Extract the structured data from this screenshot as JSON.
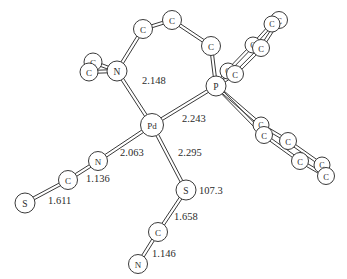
{
  "figure": {
    "background_color": "#ffffff",
    "line_color": "#3a3a3a",
    "text_color": "#2b2b2b"
  },
  "atoms": [
    {
      "id": "pd",
      "label": "Pd",
      "x": 152,
      "y": 125,
      "r": 11.5,
      "font": 9
    },
    {
      "id": "p",
      "label": "P",
      "x": 216,
      "y": 86,
      "r": 10,
      "font": 9.5
    },
    {
      "id": "n_amine",
      "label": "N",
      "x": 117,
      "y": 71,
      "r": 10,
      "font": 9.5
    },
    {
      "id": "c_me1",
      "label": "C",
      "x": 93,
      "y": 62,
      "r": 9,
      "font": 9
    },
    {
      "id": "c_me2",
      "label": "C",
      "x": 89,
      "y": 72,
      "r": 9,
      "font": 9
    },
    {
      "id": "c_br1",
      "label": "C",
      "x": 143,
      "y": 29,
      "r": 9.5,
      "font": 9
    },
    {
      "id": "c_br2",
      "label": "C",
      "x": 172,
      "y": 20,
      "r": 9.5,
      "font": 9
    },
    {
      "id": "c_br3",
      "label": "C",
      "x": 211,
      "y": 46,
      "r": 9.5,
      "font": 9
    },
    {
      "id": "ph1_c1",
      "label": "C",
      "x": 228,
      "y": 71,
      "r": 8,
      "font": 8
    },
    {
      "id": "ph1_c2",
      "label": "C",
      "x": 235,
      "y": 74,
      "r": 8.5,
      "font": 8.5
    },
    {
      "id": "ph1_c3",
      "label": "C",
      "x": 253,
      "y": 45,
      "r": 8,
      "font": 8
    },
    {
      "id": "ph1_c4",
      "label": "C",
      "x": 261,
      "y": 48,
      "r": 8.5,
      "font": 8.5
    },
    {
      "id": "ph1_c5",
      "label": "C",
      "x": 279,
      "y": 20,
      "r": 8.5,
      "font": 8.5
    },
    {
      "id": "ph1_c6",
      "label": "C",
      "x": 272,
      "y": 24,
      "r": 8,
      "font": 8
    },
    {
      "id": "ph2_c1",
      "label": "C",
      "x": 261,
      "y": 125,
      "r": 8,
      "font": 8
    },
    {
      "id": "ph2_c2",
      "label": "C",
      "x": 264,
      "y": 135,
      "r": 8.5,
      "font": 8.5
    },
    {
      "id": "ph2_c3",
      "label": "C",
      "x": 288,
      "y": 141,
      "r": 8.5,
      "font": 8.5
    },
    {
      "id": "ph2_c4",
      "label": "C",
      "x": 300,
      "y": 161,
      "r": 8.5,
      "font": 8.5
    },
    {
      "id": "ph2_c5",
      "label": "C",
      "x": 322,
      "y": 165,
      "r": 8,
      "font": 8
    },
    {
      "id": "ph2_c6",
      "label": "C",
      "x": 326,
      "y": 176,
      "r": 8.5,
      "font": 8.5
    },
    {
      "id": "n_ncs",
      "label": "N",
      "x": 98,
      "y": 161,
      "r": 9.5,
      "font": 9
    },
    {
      "id": "c_ncs",
      "label": "C",
      "x": 68,
      "y": 180,
      "r": 9.5,
      "font": 9
    },
    {
      "id": "s_ncs",
      "label": "S",
      "x": 25,
      "y": 203,
      "r": 10,
      "font": 9.5
    },
    {
      "id": "s_scn",
      "label": "S",
      "x": 186,
      "y": 190,
      "r": 10,
      "font": 9.5
    },
    {
      "id": "c_scn",
      "label": "C",
      "x": 158,
      "y": 232,
      "r": 9.5,
      "font": 9
    },
    {
      "id": "n_scn",
      "label": "N",
      "x": 138,
      "y": 264,
      "r": 9.5,
      "font": 9
    }
  ],
  "bonds": [
    {
      "from": "pd",
      "to": "n_amine",
      "style": "double"
    },
    {
      "from": "pd",
      "to": "p",
      "style": "double"
    },
    {
      "from": "pd",
      "to": "n_ncs",
      "style": "double"
    },
    {
      "from": "pd",
      "to": "s_scn",
      "style": "double"
    },
    {
      "from": "n_amine",
      "to": "c_me1",
      "style": "double"
    },
    {
      "from": "n_amine",
      "to": "c_me2",
      "style": "double"
    },
    {
      "from": "n_amine",
      "to": "c_br1",
      "style": "double"
    },
    {
      "from": "c_br1",
      "to": "c_br2",
      "style": "double"
    },
    {
      "from": "c_br2",
      "to": "c_br3",
      "style": "double"
    },
    {
      "from": "c_br3",
      "to": "p",
      "style": "double"
    },
    {
      "from": "p",
      "to": "ph1_c1",
      "style": "double"
    },
    {
      "from": "p",
      "to": "ph1_c2",
      "style": "double"
    },
    {
      "from": "ph1_c1",
      "to": "ph1_c3",
      "style": "double"
    },
    {
      "from": "ph1_c2",
      "to": "ph1_c4",
      "style": "double"
    },
    {
      "from": "ph1_c3",
      "to": "ph1_c6",
      "style": "double"
    },
    {
      "from": "ph1_c4",
      "to": "ph1_c5",
      "style": "double"
    },
    {
      "from": "ph1_c5",
      "to": "ph1_c6",
      "style": "double"
    },
    {
      "from": "p",
      "to": "ph2_c1",
      "style": "double"
    },
    {
      "from": "p",
      "to": "ph2_c2",
      "style": "double"
    },
    {
      "from": "ph2_c1",
      "to": "ph2_c3",
      "style": "double"
    },
    {
      "from": "ph2_c2",
      "to": "ph2_c4",
      "style": "double"
    },
    {
      "from": "ph2_c3",
      "to": "ph2_c5",
      "style": "double"
    },
    {
      "from": "ph2_c4",
      "to": "ph2_c6",
      "style": "double"
    },
    {
      "from": "ph2_c5",
      "to": "ph2_c6",
      "style": "double"
    },
    {
      "from": "n_ncs",
      "to": "c_ncs",
      "style": "double"
    },
    {
      "from": "c_ncs",
      "to": "s_ncs",
      "style": "double"
    },
    {
      "from": "s_scn",
      "to": "c_scn",
      "style": "double"
    },
    {
      "from": "c_scn",
      "to": "n_scn",
      "style": "double"
    }
  ],
  "measurements": [
    {
      "id": "pd-n-amine-distance",
      "text": "2.148",
      "x": 142,
      "y": 80,
      "anchor": "start"
    },
    {
      "id": "pd-p-distance",
      "text": "2.243",
      "x": 182,
      "y": 118,
      "anchor": "start"
    },
    {
      "id": "pd-n-ncs-distance",
      "text": "2.063",
      "x": 120,
      "y": 152,
      "anchor": "start"
    },
    {
      "id": "pd-s-scn-distance",
      "text": "2.295",
      "x": 178,
      "y": 152,
      "anchor": "start"
    },
    {
      "id": "n-c-ncs-distance",
      "text": "1.136",
      "x": 86,
      "y": 178,
      "anchor": "start"
    },
    {
      "id": "c-s-ncs-distance",
      "text": "1.611",
      "x": 48,
      "y": 200,
      "anchor": "start"
    },
    {
      "id": "pd-s-c-angle",
      "text": "107.3",
      "x": 199,
      "y": 190,
      "anchor": "start"
    },
    {
      "id": "s-c-scn-distance",
      "text": "1.658",
      "x": 174,
      "y": 216,
      "anchor": "start"
    },
    {
      "id": "c-n-scn-distance",
      "text": "1.146",
      "x": 152,
      "y": 253,
      "anchor": "start"
    }
  ],
  "chart_data": {
    "type": "diagram",
    "central_atom": "Pd",
    "bond_distances_angstrom": {
      "Pd-N(amine)": 2.148,
      "Pd-P": 2.243,
      "Pd-N(thiocyanate)": 2.063,
      "Pd-S(thiocyanate)": 2.295,
      "N-C(isothiocyanate)": 1.136,
      "C-S(isothiocyanate)": 1.611,
      "S-C(thiocyanate)": 1.658,
      "C-N(thiocyanate)": 1.146
    },
    "bond_angles_degrees": {
      "Pd-S-C": 107.3
    },
    "element_counts": {
      "Pd": 1,
      "P": 1,
      "N": 3,
      "S": 2,
      "C": 19
    }
  }
}
